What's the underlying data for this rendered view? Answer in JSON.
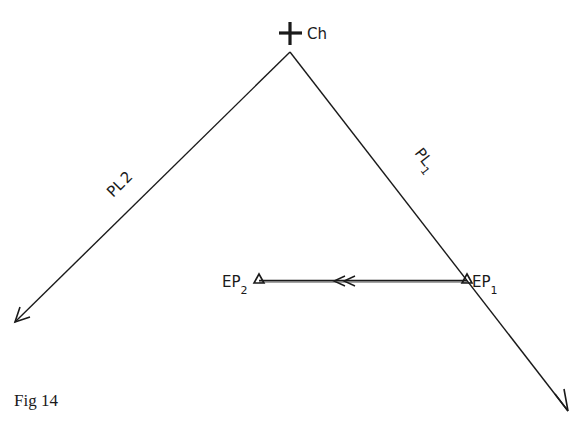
{
  "figure": {
    "caption": "Fig 14",
    "stroke_color": "#1a1a1a",
    "background": "#ffffff"
  },
  "points": {
    "church": {
      "label": "Ch",
      "x": 290,
      "y": 52
    },
    "ep1": {
      "label": "EP",
      "subscript": "1",
      "x": 467,
      "y": 280
    },
    "ep2": {
      "label": "EP",
      "subscript": "2",
      "x": 259,
      "y": 280
    }
  },
  "lines": {
    "pl1": {
      "label": "PL",
      "subscript": "1"
    },
    "pl2": {
      "label": "PL",
      "subscript": "2"
    }
  }
}
